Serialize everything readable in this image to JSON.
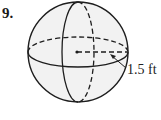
{
  "problem": {
    "number": "9."
  },
  "figure": {
    "shape": "sphere",
    "radius_label": "1.5 ft",
    "colors": {
      "fill": "#f2f2f2",
      "stroke": "#1e1e1e"
    }
  }
}
